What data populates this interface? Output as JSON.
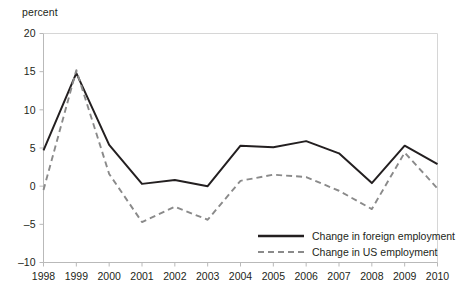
{
  "chart_data": {
    "type": "line",
    "title": "",
    "subtitle": "",
    "xlabel": "",
    "ylabel": "percent",
    "ylim": [
      -10,
      20
    ],
    "xlim": [
      1998,
      2010
    ],
    "yticks": [
      20,
      15,
      10,
      5,
      0,
      -5,
      -10
    ],
    "ytick_labels": [
      "20",
      "15",
      "10",
      "5",
      "0",
      "–5",
      "–10"
    ],
    "grid": false,
    "legend_position": "bottom-right",
    "categories": [
      1998,
      1999,
      2000,
      2001,
      2002,
      2003,
      2004,
      2005,
      2006,
      2007,
      2008,
      2009,
      2010
    ],
    "xtick_labels": [
      "1998",
      "1999",
      "2000",
      "2001",
      "2002",
      "2003",
      "2004",
      "2005",
      "2006",
      "2007",
      "2008",
      "2009",
      "2010"
    ],
    "series": [
      {
        "name": "Change in foreign employment",
        "style": "solid",
        "color": "#231f20",
        "values": [
          4.7,
          14.8,
          5.4,
          0.3,
          0.8,
          0.0,
          5.3,
          5.1,
          5.9,
          4.3,
          0.4,
          5.3,
          2.9
        ]
      },
      {
        "name": "Change in US employment",
        "style": "dashed",
        "color": "#8a8a8a",
        "values": [
          -0.5,
          15.2,
          1.6,
          -4.7,
          -2.7,
          -4.4,
          0.7,
          1.5,
          1.2,
          -0.6,
          -3.0,
          4.4,
          -0.3
        ]
      }
    ]
  },
  "axis": {
    "unit_label": "percent"
  },
  "legend": {
    "items": [
      {
        "label": "Change in foreign employment",
        "style": "solid"
      },
      {
        "label": "Change in US employment",
        "style": "dashed"
      }
    ]
  }
}
